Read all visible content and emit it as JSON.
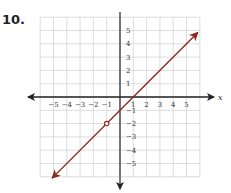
{
  "problem": {
    "number": "10."
  },
  "colors": {
    "line": "#8b2a1f",
    "grid": "#d4d4d4",
    "axis": "#222222"
  },
  "chart_data": {
    "type": "line",
    "title": "",
    "xlabel": "x",
    "ylabel": "",
    "xlim": [
      -6,
      6
    ],
    "ylim": [
      -6,
      6
    ],
    "grid": true,
    "x_ticks": [
      "−5",
      "−4",
      "−3",
      "−2",
      "−1",
      "1",
      "2",
      "3",
      "4",
      "5"
    ],
    "y_ticks": [
      "5",
      "4",
      "3",
      "2",
      "1",
      "−1",
      "−2",
      "−3",
      "−4",
      "−5"
    ],
    "series": [
      {
        "name": "y = x − 1",
        "equation": "y = x - 1",
        "x": [
          -5.5,
          -1,
          1,
          5.5
        ],
        "y": [
          -6.5,
          -2,
          0,
          4.5
        ],
        "arrows_both_ends": true
      }
    ],
    "annotations": [
      {
        "type": "open-circle",
        "x": -1,
        "y": -2
      }
    ]
  }
}
